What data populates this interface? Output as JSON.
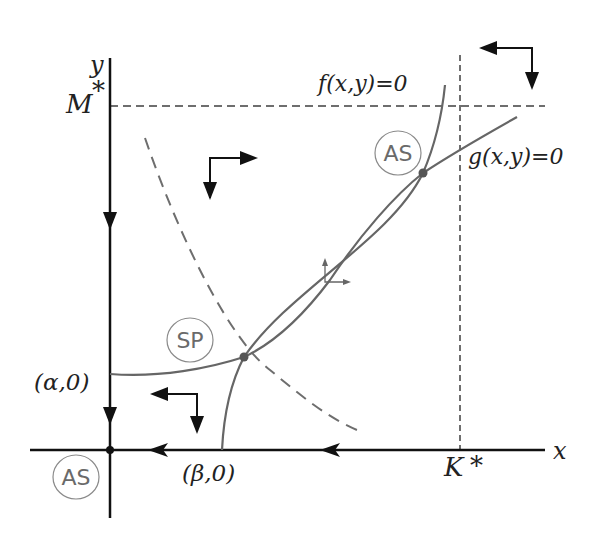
{
  "diagram": {
    "type": "phase-plane",
    "axes": {
      "x_label": "x",
      "y_label": "y"
    },
    "reference_lines": {
      "horizontal": {
        "label": "M",
        "superscript": "*"
      },
      "vertical": {
        "label": "K",
        "superscript": "*"
      }
    },
    "curves": {
      "f": {
        "label": "f(x,y)=0"
      },
      "g": {
        "label": "g(x,y)=0"
      }
    },
    "points": {
      "alpha": {
        "label": "(α,0)"
      },
      "beta": {
        "label": "(β,0)"
      }
    },
    "equilibria": [
      {
        "id": "interior-stable",
        "label": "AS"
      },
      {
        "id": "saddle",
        "label": "SP"
      },
      {
        "id": "origin-stable",
        "label": "AS"
      }
    ],
    "colors": {
      "axis": "#111111",
      "curve": "#666666",
      "dashed": "#6e6e6e",
      "badge_border": "#8a8a8a",
      "badge_text": "#6a6a6a",
      "background": "#ffffff"
    }
  }
}
